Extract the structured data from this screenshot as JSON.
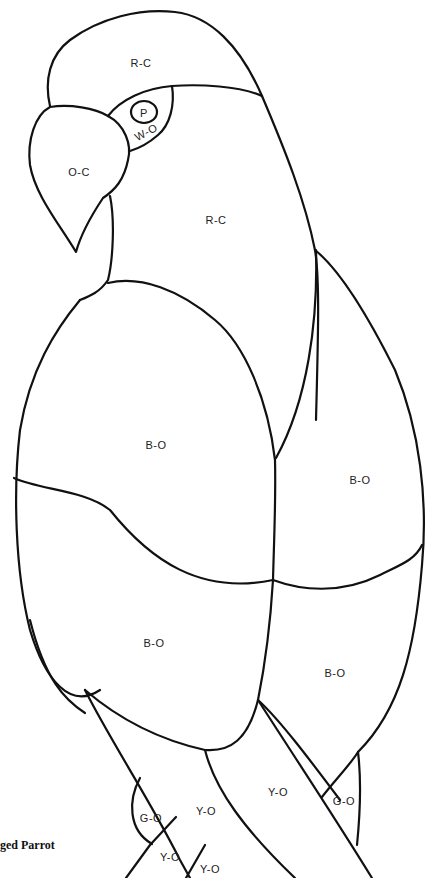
{
  "figure": {
    "type": "stained-glass pattern line drawing",
    "subject": "Parrot",
    "caption": "ged Parrot"
  },
  "labels": [
    {
      "id": "head-top",
      "text": "R-C",
      "x": 141,
      "y": 63
    },
    {
      "id": "eye-pupil",
      "text": "P",
      "x": 144,
      "y": 113
    },
    {
      "id": "eye-ring",
      "text": "W-O",
      "x": 146,
      "y": 132
    },
    {
      "id": "beak",
      "text": "O-C",
      "x": 79,
      "y": 172
    },
    {
      "id": "neck",
      "text": "R-C",
      "x": 216,
      "y": 220
    },
    {
      "id": "wing-upper-left",
      "text": "B-O",
      "x": 156,
      "y": 445
    },
    {
      "id": "wing-upper-right",
      "text": "B-O",
      "x": 360,
      "y": 480
    },
    {
      "id": "wing-lower-left",
      "text": "B-O",
      "x": 154,
      "y": 643
    },
    {
      "id": "wing-lower-right",
      "text": "B-O",
      "x": 335,
      "y": 673
    },
    {
      "id": "tail-center-right",
      "text": "Y-O",
      "x": 278,
      "y": 792
    },
    {
      "id": "tail-center-left",
      "text": "Y-O",
      "x": 206,
      "y": 811
    },
    {
      "id": "foot-right",
      "text": "G-O",
      "x": 344,
      "y": 801
    },
    {
      "id": "foot-left",
      "text": "G-O",
      "x": 151,
      "y": 818
    },
    {
      "id": "tail-low-1",
      "text": "Y-O",
      "x": 170,
      "y": 857
    },
    {
      "id": "tail-low-2",
      "text": "Y-O",
      "x": 210,
      "y": 869
    }
  ],
  "colors": {
    "line": "#111111",
    "background": "#ffffff"
  }
}
